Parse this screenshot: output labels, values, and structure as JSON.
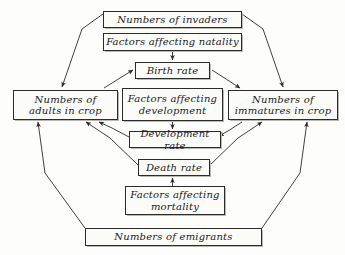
{
  "diagram": {
    "type": "flow-diagram",
    "style": "hexagonal boxed flow chart, hand-lettered italic labels",
    "ink_color": "#2b2b2b",
    "background_color": "#fdfdfb",
    "nodes": {
      "invaders": "Numbers of invaders",
      "natality_factors": "Factors affecting natality",
      "birth_rate": "Birth rate",
      "adults": "Numbers of\nadults in crop",
      "development_factors": "Factors affecting\ndevelopment",
      "immatures": "Numbers of\nimmatures in crop",
      "development_rate": "Development rate",
      "death_rate": "Death rate",
      "mortality_factors": "Factors affecting\nmortality",
      "emigrants": "Numbers of emigrants"
    },
    "edges": [
      {
        "from": "invaders",
        "to": "adults",
        "kind": "diagonal-arrow"
      },
      {
        "from": "invaders",
        "to": "immatures",
        "kind": "diagonal-arrow"
      },
      {
        "from": "natality_factors",
        "to": "birth_rate",
        "kind": "vertical-arrow"
      },
      {
        "from": "adults",
        "to": "birth_rate",
        "kind": "diagonal-arrow"
      },
      {
        "from": "birth_rate",
        "to": "immatures",
        "kind": "diagonal-arrow"
      },
      {
        "from": "development_factors",
        "to": "development_rate",
        "kind": "vertical-arrow"
      },
      {
        "from": "immatures",
        "to": "development_rate",
        "kind": "diagonal-arrow"
      },
      {
        "from": "development_rate",
        "to": "adults",
        "kind": "diagonal-arrow"
      },
      {
        "from": "death_rate",
        "to": "adults",
        "kind": "diagonal-arrow"
      },
      {
        "from": "death_rate",
        "to": "immatures",
        "kind": "diagonal-arrow"
      },
      {
        "from": "mortality_factors",
        "to": "death_rate",
        "kind": "vertical-arrow"
      },
      {
        "from": "emigrants",
        "to": "adults",
        "kind": "diagonal-arrow"
      },
      {
        "from": "emigrants",
        "to": "immatures",
        "kind": "diagonal-arrow"
      }
    ]
  }
}
